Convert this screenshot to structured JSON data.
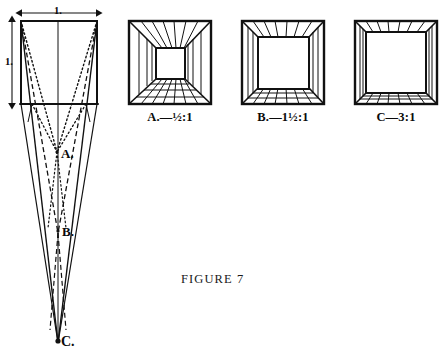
{
  "figure": {
    "caption_prefix": "F",
    "caption_rest": "IGURE",
    "caption_number": "7",
    "caption_full": "FIGURE 7"
  },
  "left_diagram": {
    "name": "vanishing-point-construction",
    "width_label": "1.",
    "height_label": "1.",
    "vanishing_points": [
      {
        "id": "A",
        "label": "A.",
        "x": 57,
        "y": 155,
        "line_style": "dotted"
      },
      {
        "id": "B",
        "label": "B.",
        "x": 58,
        "y": 233,
        "line_style": "dashed"
      },
      {
        "id": "C",
        "label": "C.",
        "x": 58,
        "y": 343,
        "line_style": "solid"
      }
    ],
    "square": {
      "x": 21,
      "y": 21,
      "w": 76,
      "h": 83
    }
  },
  "boxes": [
    {
      "id": "A",
      "caption": "A.—½:1",
      "ratio_text": "½:1",
      "letter": "A.",
      "dash": "—",
      "outer": {
        "x": 129,
        "y": 21,
        "w": 82,
        "h": 83
      },
      "inner": {
        "x": 156,
        "y": 48,
        "w": 29,
        "h": 31
      },
      "depth": "deep"
    },
    {
      "id": "B",
      "caption": "B.—1½:1",
      "ratio_text": "1½:1",
      "letter": "B.",
      "dash": "—",
      "outer": {
        "x": 242,
        "y": 21,
        "w": 82,
        "h": 83
      },
      "inner": {
        "x": 258,
        "y": 37,
        "w": 51,
        "h": 52
      },
      "depth": "medium"
    },
    {
      "id": "C",
      "caption": "C—3:1",
      "ratio_text": "3:1",
      "letter": "C",
      "dash": "—",
      "outer": {
        "x": 355,
        "y": 21,
        "w": 82,
        "h": 83
      },
      "inner": {
        "x": 366,
        "y": 32,
        "w": 60,
        "h": 61
      },
      "depth": "shallow"
    }
  ],
  "colors": {
    "ink": "#111111",
    "paper": "#ffffff"
  }
}
